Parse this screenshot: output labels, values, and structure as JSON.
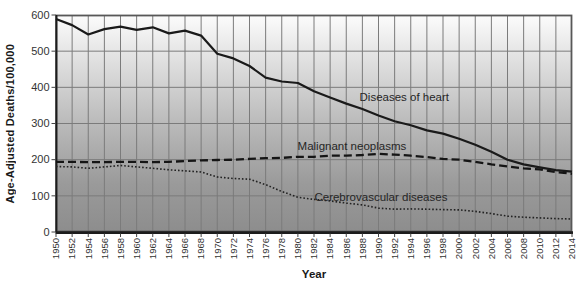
{
  "figure": {
    "background": "#ffffff",
    "plot": {
      "left": 56,
      "top": 15,
      "width": 516,
      "height": 217,
      "bg_gradient": [
        "#fcfcfc",
        "#e4e4e4",
        "#bababa",
        "#9a9a9a",
        "#8d8d8d"
      ],
      "grid_color": "#7b7b7b",
      "border_color": "#585858",
      "axis_color": "#1c1c1c",
      "tick_label_color": "#333333"
    }
  },
  "chart_data": {
    "type": "line",
    "title": "",
    "xlabel": "Year",
    "ylabel": "Age-Adjusted Deaths/100,000",
    "xlim": [
      1950,
      2014
    ],
    "ylim": [
      0,
      600
    ],
    "y_ticks": [
      0,
      100,
      200,
      300,
      400,
      500,
      600
    ],
    "grid": true,
    "legend": "inline-annotations",
    "x": [
      1950,
      1952,
      1954,
      1956,
      1958,
      1960,
      1962,
      1964,
      1966,
      1968,
      1970,
      1972,
      1974,
      1976,
      1978,
      1980,
      1982,
      1984,
      1986,
      1988,
      1990,
      1992,
      1994,
      1996,
      1998,
      2000,
      2002,
      2004,
      2006,
      2008,
      2010,
      2012,
      2014
    ],
    "series": [
      {
        "name": "Diseases of heart",
        "style": "solid",
        "color": "#1a1a1a",
        "stroke_width": 2.2,
        "values": [
          589,
          572,
          546,
          561,
          568,
          559,
          566,
          549,
          557,
          543,
          493,
          480,
          459,
          427,
          416,
          412,
          389,
          372,
          355,
          340,
          322,
          306,
          295,
          281,
          272,
          258,
          241,
          222,
          200,
          187,
          179,
          171,
          167
        ],
        "label_anchor": {
          "x": 1993.2,
          "y": 373
        }
      },
      {
        "name": "Malignant neoplasms",
        "style": "dashed",
        "color": "#151515",
        "stroke_width": 2.3,
        "values": [
          194,
          194,
          193,
          193,
          194,
          194,
          193,
          194,
          196,
          198,
          199,
          200,
          202,
          204,
          205,
          208,
          208,
          211,
          211,
          213,
          216,
          214,
          211,
          207,
          202,
          200,
          194,
          187,
          181,
          176,
          173,
          166,
          161
        ],
        "label_anchor": {
          "x": 1986.7,
          "y": 238
        }
      },
      {
        "name": "Cerebrovascular diseases",
        "style": "dotted",
        "color": "#222222",
        "stroke_width": 1.6,
        "values": [
          181,
          180,
          176,
          180,
          184,
          180,
          176,
          172,
          169,
          166,
          152,
          148,
          146,
          131,
          112,
          96,
          90,
          86,
          80,
          75,
          66,
          63,
          64,
          63,
          62,
          61,
          57,
          51,
          44,
          41,
          39,
          37,
          36
        ],
        "label_anchor": {
          "x": 1990.3,
          "y": 97
        }
      }
    ],
    "annotation_color": "#262626",
    "annotation_font_size": 11.5,
    "x_tick_font_size": 9.5,
    "y_tick_font_size": 11
  }
}
